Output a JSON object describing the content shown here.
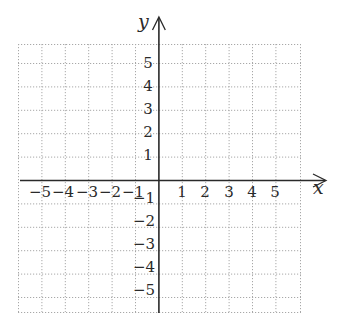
{
  "diagram": {
    "type": "coordinate-plane",
    "axes": {
      "x_label": "x",
      "y_label": "y"
    },
    "x_ticks": [
      "−5",
      "−4",
      "−3",
      "−2",
      "−1",
      "1",
      "2",
      "3",
      "4",
      "5"
    ],
    "y_ticks_positive": [
      "5",
      "4",
      "3",
      "2",
      "1"
    ],
    "y_ticks_negative": [
      "−1",
      "−2",
      "−3",
      "−4",
      "−5"
    ],
    "grid": {
      "style": "dotted",
      "step": 1,
      "range_x": [
        -6,
        6
      ],
      "range_y": [
        -5.6,
        5.8
      ]
    },
    "colors": {
      "axis": "#2a2a2a",
      "grid": "#9a9a9a",
      "background": "#ffffff"
    }
  }
}
